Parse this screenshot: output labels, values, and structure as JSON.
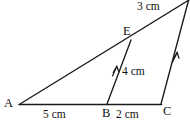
{
  "figure": {
    "type": "geometry-diagram",
    "stroke_color": "#1a1a1a",
    "background_color": "#ffffff",
    "vertices": [
      {
        "id": "A",
        "label": "A",
        "x": 20,
        "y": 104
      },
      {
        "id": "B",
        "label": "B",
        "x": 107,
        "y": 104
      },
      {
        "id": "C",
        "label": "C",
        "x": 161,
        "y": 104
      },
      {
        "id": "E",
        "label": "E",
        "x": 131,
        "y": 40
      },
      {
        "id": "D",
        "label": "",
        "x": 188,
        "y": 1
      }
    ],
    "segments": [
      {
        "id": "AD",
        "from": "A",
        "to": "D",
        "style": "plain"
      },
      {
        "id": "AC",
        "from": "A",
        "to": "C",
        "style": "baseline"
      },
      {
        "id": "BE",
        "from": "B",
        "to": "E",
        "style": "single-arrow"
      },
      {
        "id": "CD",
        "from": "C",
        "to": "D",
        "style": "single-arrow"
      }
    ],
    "measurements": [
      {
        "id": "AB",
        "text": "5 cm",
        "segment": "A-B"
      },
      {
        "id": "BC",
        "text": "2 cm",
        "segment": "B-C"
      },
      {
        "id": "BE",
        "text": "4 cm",
        "segment": "B-E"
      },
      {
        "id": "ED",
        "text": "3 cm",
        "segment": "E-D"
      }
    ],
    "arrow_marks": [
      {
        "on": "BE",
        "x": 116,
        "y": 70
      },
      {
        "on": "CD",
        "x": 176,
        "y": 56
      }
    ]
  }
}
